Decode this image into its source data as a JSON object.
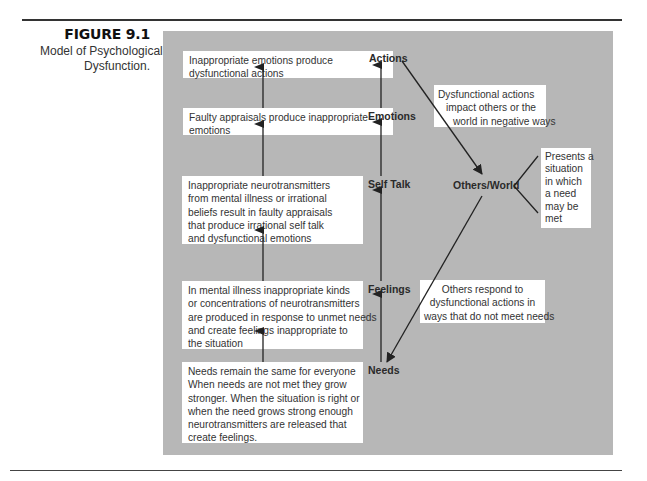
{
  "figure": {
    "number": "FIGURE 9.1",
    "caption_lines": [
      "Model of Psychological",
      "Dysfunction."
    ]
  },
  "left_boxes": [
    {
      "lines": [
        "Inappropriate emotions produce",
        "dysfunctional actions"
      ]
    },
    {
      "lines": [
        "Faulty appraisals produce inappropriate",
        "emotions"
      ]
    },
    {
      "lines": [
        "Inappropriate neurotransmitters",
        "from mental illness or irrational",
        "beliefs result in faulty appraisals",
        "that produce irrational self talk",
        "and dysfunctional emotions"
      ]
    },
    {
      "lines": [
        "In mental illness inappropriate kinds",
        "or concentrations of neurotransmitters",
        "are produced in response to unmet needs",
        "and create feelings inappropriate to",
        "the situation"
      ]
    },
    {
      "lines": [
        "Needs remain the same for everyone",
        "When needs are not met they grow",
        "stronger. When the situation is right or",
        "when the need grows strong enough",
        "neurotransmitters are released that",
        "create feelings."
      ]
    }
  ],
  "stages": {
    "actions": "Actions",
    "emotions": "Emotions",
    "self_talk": "Self Talk",
    "feelings": "Feelings",
    "needs": "Needs",
    "others_world": "Others/World"
  },
  "right_boxes": {
    "impact": {
      "lines": [
        "Dysfunctional actions",
        "impact others or the",
        "world in negative ways"
      ]
    },
    "presents": {
      "lines": [
        "Presents a",
        "situation",
        "in which",
        "a need",
        "may be",
        "met"
      ]
    },
    "respond": {
      "lines": [
        "Others respond to",
        "dysfunctional actions in",
        "ways that do not meet needs"
      ]
    }
  },
  "colors": {
    "panel": "#b7b7b7",
    "box": "#ffffff",
    "arrow": "#222222"
  }
}
